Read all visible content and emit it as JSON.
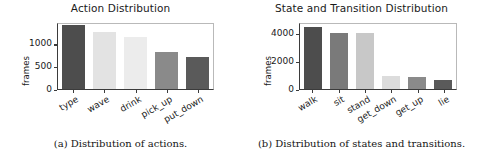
{
  "figure": {
    "panels": [
      {
        "id": "a",
        "caption": "(a) Distribution of actions.",
        "chart_data": {
          "type": "bar",
          "title": "Action Distribution",
          "xlabel": "",
          "ylabel": "frames",
          "categories": [
            "type",
            "wave",
            "drink",
            "pick_up",
            "put_down"
          ],
          "values": [
            1400,
            1240,
            1150,
            820,
            710
          ],
          "colors": [
            "#4d4d4d",
            "#e3e3e3",
            "#ececec",
            "#8a8a8a",
            "#5a5a5a"
          ],
          "yticks": [
            0,
            500,
            1000
          ],
          "yticklabels": [
            "0",
            "500",
            "1000"
          ],
          "ylim": [
            0,
            1470
          ],
          "grid": false,
          "legend": "none",
          "xtick_rotation": -30
        }
      },
      {
        "id": "b",
        "caption": "(b) Distribution of states and transitions.",
        "chart_data": {
          "type": "bar",
          "title": "State and Transition Distribution",
          "xlabel": "",
          "ylabel": "frames",
          "categories": [
            "walk",
            "sit",
            "stand",
            "get_down",
            "get_up",
            "lie"
          ],
          "values": [
            4400,
            4000,
            4000,
            900,
            880,
            620
          ],
          "colors": [
            "#4d4d4d",
            "#7a7a7a",
            "#c8c8c8",
            "#dcdcdc",
            "#8a8a8a",
            "#5a5a5a"
          ],
          "yticks": [
            0,
            2000,
            4000
          ],
          "yticklabels": [
            "0",
            "2000",
            "4000"
          ],
          "ylim": [
            0,
            4750
          ],
          "grid": false,
          "legend": "none",
          "xtick_rotation": -30
        }
      }
    ]
  }
}
